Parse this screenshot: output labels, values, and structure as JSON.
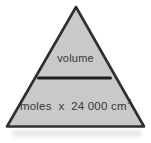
{
  "figure": {
    "top_label": "volume",
    "bottom_label": "moles  x  24 000 cm",
    "bottom_exponent": "3"
  },
  "icons": {
    "divider": "fraction-bar"
  },
  "colors": {
    "background": "#ffffff",
    "triangle_fill": "#c9c9c9",
    "triangle_outline": "#2e2e2e",
    "divider": "#1f1f1f",
    "text": "#363636",
    "scan_shadow": "#d7d7d7"
  }
}
